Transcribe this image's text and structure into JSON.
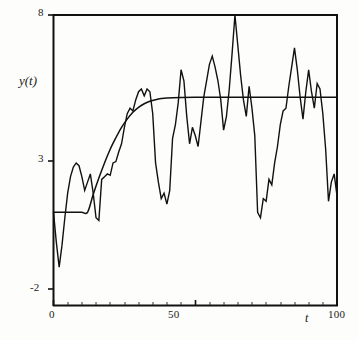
{
  "chart_data": {
    "type": "line",
    "title": "",
    "subtitle": "",
    "xlabel": "t",
    "ylabel": "y(t)",
    "xlim": [
      0,
      100
    ],
    "ylim": [
      -2,
      8
    ],
    "xticks": [
      0,
      50,
      100
    ],
    "xticklabels": [
      "0",
      "50",
      "100"
    ],
    "yticks": [
      -2,
      3,
      8
    ],
    "yticklabels": [
      "-2",
      "3",
      "8"
    ],
    "grid": false,
    "legend": null,
    "minor_xticks": true,
    "frame": "top-right-box",
    "series": [
      {
        "name": "mean-response",
        "style": "smooth",
        "description": "smooth saturating mean curve rising from about 0.8 at t=12 to an asymptote of about 5",
        "x": [
          0,
          2,
          4,
          6,
          8,
          10,
          12,
          14,
          16,
          18,
          20,
          22,
          24,
          26,
          28,
          30,
          32,
          34,
          36,
          38,
          40,
          45,
          50,
          55,
          60,
          65,
          70,
          75,
          80,
          85,
          90,
          95,
          100
        ],
        "y": [
          0.8,
          0.8,
          0.8,
          0.8,
          0.8,
          0.8,
          0.8,
          1.45,
          2.05,
          2.6,
          3.1,
          3.52,
          3.9,
          4.2,
          4.45,
          4.63,
          4.76,
          4.85,
          4.91,
          4.95,
          4.97,
          4.99,
          5.0,
          5.0,
          5.0,
          5.0,
          5.0,
          5.0,
          5.0,
          5.0,
          5.0,
          5.0,
          5.0
        ]
      },
      {
        "name": "simulated-realization",
        "style": "noisy",
        "description": "jagged stochastic realization oscillating about the mean curve, peaking at 8 near t=64 and dropping to about 1.2 at t=97",
        "x": [
          0,
          1,
          2,
          3,
          4,
          5,
          6,
          7,
          8,
          9,
          10,
          11,
          12,
          13,
          14,
          15,
          16,
          17,
          18,
          19,
          20,
          21,
          22,
          23,
          24,
          25,
          26,
          27,
          28,
          29,
          30,
          31,
          32,
          33,
          34,
          35,
          36,
          37,
          38,
          39,
          40,
          41,
          42,
          43,
          44,
          45,
          46,
          47,
          48,
          49,
          50,
          51,
          52,
          53,
          54,
          55,
          56,
          57,
          58,
          59,
          60,
          61,
          62,
          63,
          64,
          65,
          66,
          67,
          68,
          69,
          70,
          71,
          72,
          73,
          74,
          75,
          76,
          77,
          78,
          79,
          80,
          81,
          82,
          83,
          84,
          85,
          86,
          87,
          88,
          89,
          90,
          91,
          92,
          93,
          94,
          95,
          96,
          97,
          98,
          99,
          100
        ],
        "y": [
          0.8,
          -0.3,
          -1.2,
          -0.4,
          0.6,
          1.5,
          2.1,
          2.45,
          2.6,
          2.5,
          2.1,
          1.6,
          1.9,
          2.2,
          1.5,
          0.6,
          0.5,
          2.0,
          2.1,
          2.2,
          2.15,
          2.6,
          2.65,
          3.0,
          3.3,
          3.9,
          4.4,
          4.6,
          4.5,
          4.9,
          5.2,
          5.3,
          5.05,
          5.3,
          5.2,
          4.4,
          2.6,
          1.9,
          1.3,
          1.5,
          1.1,
          1.6,
          3.5,
          4.0,
          4.8,
          6.0,
          5.6,
          4.3,
          3.3,
          3.9,
          3.6,
          3.2,
          4.1,
          5.0,
          5.6,
          6.2,
          6.5,
          6.1,
          5.6,
          4.9,
          3.8,
          4.3,
          5.3,
          6.6,
          8.0,
          6.9,
          5.8,
          4.9,
          4.3,
          5.4,
          4.6,
          3.6,
          0.8,
          0.6,
          1.3,
          1.2,
          2.0,
          1.8,
          2.6,
          3.2,
          4.0,
          4.5,
          4.6,
          5.4,
          6.1,
          6.8,
          6.0,
          5.0,
          4.2,
          5.2,
          6.0,
          5.2,
          4.6,
          5.5,
          5.3,
          4.4,
          3.1,
          1.2,
          1.9,
          2.2,
          1.4
        ]
      }
    ]
  },
  "axes": {
    "y_tick_8": "8",
    "y_tick_3": "3",
    "y_tick_minus2": "-2",
    "x_tick_0": "0",
    "x_tick_50": "50",
    "x_tick_100": "100",
    "y_axis_title": "y(t)",
    "x_axis_title": "t"
  }
}
